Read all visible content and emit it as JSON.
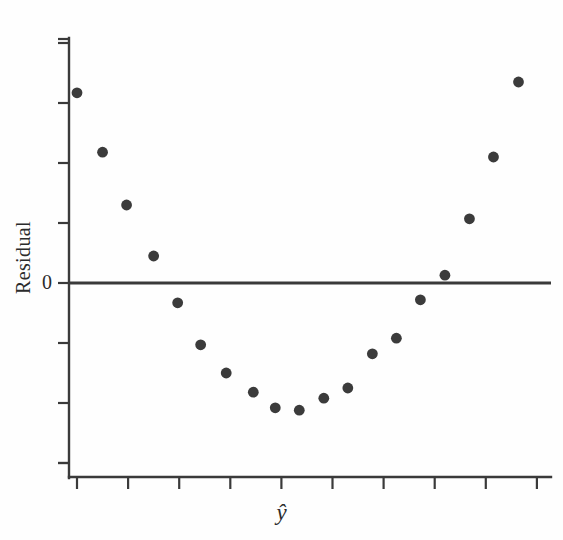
{
  "chart_data": {
    "type": "scatter",
    "title": "",
    "subtitle": "",
    "xlabel": "ŷ",
    "ylabel": "Residual",
    "grid": false,
    "legend": null,
    "annotations": [
      "Residuals show a pronounced U-shaped (curvilinear) pattern versus fitted values"
    ],
    "xlim": [
      0,
      10
    ],
    "ylim": [
      -3.4,
      4.2
    ],
    "yticks": [
      4,
      3,
      2,
      1,
      0,
      -1,
      -2,
      -3
    ],
    "ytick_labels": [
      "",
      "",
      "",
      "",
      "0",
      "",
      "",
      ""
    ],
    "xticks": [
      1,
      2,
      3,
      4,
      5,
      6,
      7,
      8,
      9,
      10
    ],
    "xtick_labels": [
      "",
      "",
      "",
      "",
      "",
      "",
      "",
      "",
      "",
      ""
    ],
    "reference_line": {
      "axis": "y",
      "value": 0
    },
    "series": [
      {
        "name": "residuals",
        "marker": "filled-circle",
        "color": "#3b3b3b",
        "x": [
          1.0,
          1.5,
          1.97,
          2.5,
          2.97,
          3.42,
          3.92,
          4.45,
          4.88,
          5.35,
          5.83,
          6.3,
          6.78,
          7.25,
          7.72,
          8.2,
          8.68,
          9.15,
          9.64
        ],
        "y": [
          3.17,
          2.18,
          1.3,
          0.45,
          -0.33,
          -1.03,
          -1.5,
          -1.82,
          -2.08,
          -2.12,
          -1.92,
          -1.75,
          -1.18,
          -0.92,
          -0.28,
          0.13,
          1.07,
          2.1,
          3.35
        ]
      }
    ]
  },
  "axes": {
    "zero_label": "0",
    "y_axis_title": "Residual",
    "x_axis_title": "ŷ",
    "x_axis_title_base": "y",
    "x_axis_title_accent": "ˆ"
  },
  "colors": {
    "axis": "#3a3a3a",
    "marker": "#3b3b3b",
    "background": "#fefefe",
    "text": "#2b2b2b"
  }
}
